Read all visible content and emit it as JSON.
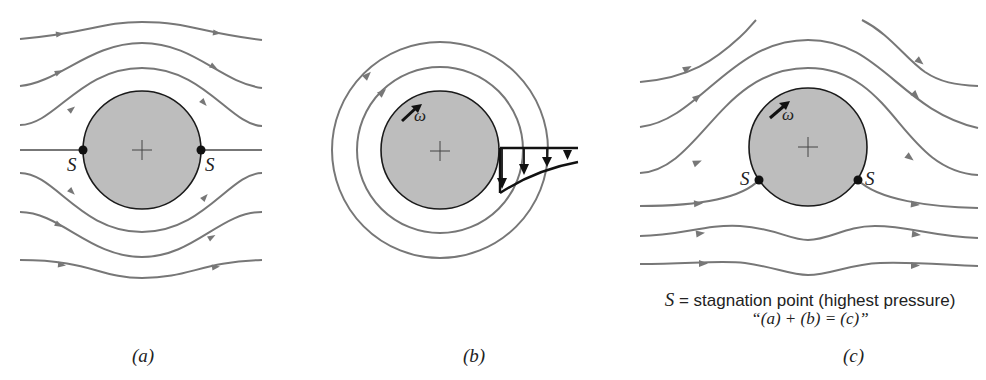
{
  "figure": {
    "panels": [
      {
        "id": "a",
        "caption": "(a)",
        "description": "Uniform flow past a non-rotating cylinder",
        "stagnation_labels": [
          "S",
          "S"
        ]
      },
      {
        "id": "b",
        "caption": "(b)",
        "description": "Circulating (rotating) flow around a cylinder with velocity profile",
        "rotation_label": "ω"
      },
      {
        "id": "c",
        "caption": "(c)",
        "description": "Superposition: flow past a rotating cylinder",
        "rotation_label": "ω",
        "stagnation_labels": [
          "S",
          "S"
        ]
      }
    ],
    "legend": {
      "symbol": "S",
      "definition": " = stagnation point (highest pressure)",
      "equation": "“(a) + (b) = (c)”"
    },
    "colors": {
      "streamline": "#777777",
      "cylinder_fill": "#bdbdbd",
      "outline": "#1a1a1a",
      "background": "#ffffff"
    }
  }
}
